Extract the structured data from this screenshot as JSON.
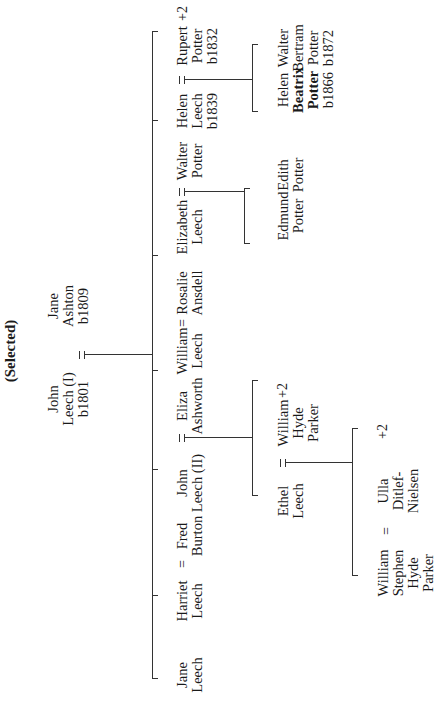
{
  "title": "(Selected)",
  "generation_1": {
    "husband": {
      "lines": [
        "John",
        "Leech (I)",
        "b1801"
      ]
    },
    "wife": {
      "lines": [
        "Jane",
        "Ashton",
        "b1809"
      ]
    },
    "marriage_symbol": "="
  },
  "generation_2": [
    {
      "lines": [
        "Jane",
        "Leech"
      ]
    },
    {
      "lines": [
        "Harriet",
        "Leech"
      ],
      "spouse": {
        "lines": [
          "Fred",
          "Burton"
        ]
      },
      "marriage_symbol": "="
    },
    {
      "lines": [
        "John",
        "Leech (II)"
      ],
      "spouse": {
        "lines": [
          "Eliza",
          "Ashworth"
        ]
      },
      "marriage_symbol": "="
    },
    {
      "lines": [
        "William",
        "Leech"
      ],
      "spouse": {
        "lines": [
          "Rosalie",
          "Ansdell"
        ]
      },
      "marriage_symbol": "="
    },
    {
      "lines": [
        "Elizabeth",
        "Leech"
      ],
      "spouse": {
        "lines": [
          "Walter",
          "Potter"
        ]
      },
      "marriage_symbol": "="
    },
    {
      "lines": [
        "Helen",
        "Leech",
        "b1839"
      ],
      "spouse": {
        "lines": [
          "Rupert",
          "Potter",
          "b1832"
        ],
        "extra": "+2"
      },
      "marriage_symbol": "="
    }
  ],
  "generation_3": {
    "john_leech_ii_children": [
      {
        "lines": [
          "Ethel",
          "Leech"
        ],
        "spouse": {
          "lines": [
            "William",
            "Hyde",
            "Parker"
          ],
          "extra": "+2"
        },
        "marriage_symbol": "="
      }
    ],
    "elizabeth_leech_children": [
      {
        "lines": [
          "Edmund",
          "Potter"
        ]
      },
      {
        "lines": [
          "Edith",
          "Potter"
        ]
      }
    ],
    "helen_leech_children": [
      {
        "lines": [
          "Helen",
          "Beatrix",
          "Potter",
          "b1866"
        ],
        "selected": true
      },
      {
        "lines": [
          "Walter",
          "Bertram",
          "Potter",
          "b1872"
        ]
      }
    ]
  },
  "generation_4": {
    "ethel_leech_children": [
      {
        "lines": [
          "William",
          "Stephen",
          "Hyde",
          "Parker"
        ],
        "spouse": {
          "lines": [
            "Ulla",
            "Ditlef-",
            "Nielsen"
          ],
          "extra": "+2"
        },
        "marriage_symbol": "="
      }
    ]
  },
  "colors": {
    "line": "#333333",
    "text": "#1a1a1a",
    "background": "#ffffff"
  }
}
